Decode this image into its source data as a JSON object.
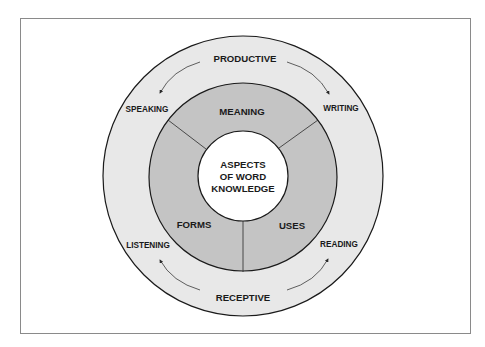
{
  "diagram": {
    "type": "concentric-circles",
    "center": {
      "lines": [
        "ASPECTS",
        "OF WORD",
        "KNOWLEDGE"
      ]
    },
    "middle_ring": {
      "segments": [
        {
          "label": "MEANING",
          "position": "top"
        },
        {
          "label": "FORMS",
          "position": "bottom-left"
        },
        {
          "label": "USES",
          "position": "bottom-right"
        }
      ]
    },
    "outer_ring": {
      "top_label": "PRODUCTIVE",
      "bottom_label": "RECEPTIVE",
      "skills": [
        {
          "label": "SPEAKING",
          "position": "upper-left"
        },
        {
          "label": "WRITING",
          "position": "upper-right"
        },
        {
          "label": "LISTENING",
          "position": "lower-left"
        },
        {
          "label": "READING",
          "position": "lower-right"
        }
      ],
      "arrows": [
        {
          "from": "PRODUCTIVE",
          "to": "SPEAKING"
        },
        {
          "from": "PRODUCTIVE",
          "to": "WRITING"
        },
        {
          "from": "RECEPTIVE",
          "to": "LISTENING"
        },
        {
          "from": "RECEPTIVE",
          "to": "READING"
        }
      ]
    },
    "colors": {
      "outer_ring": "#e8e8e8",
      "middle_ring": "#c4c4c4",
      "center": "#ffffff",
      "stroke": "#1a1a1a",
      "frame": "#8a8a8a"
    }
  }
}
